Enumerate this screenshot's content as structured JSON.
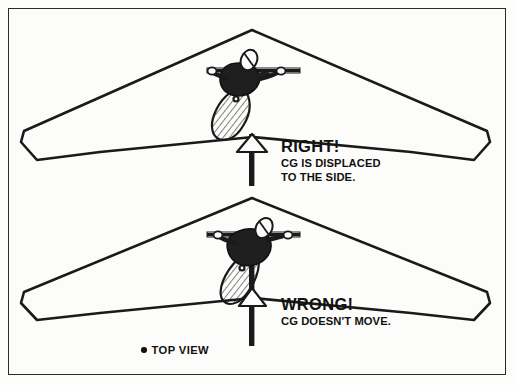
{
  "figure": {
    "background_color": "#fcfcfa",
    "ink_color": "#1a1a1a",
    "border_color": "#2b2b2b"
  },
  "panels": [
    {
      "id": "upper",
      "verdict": "RIGHT!",
      "explanation_line_1": "CG IS DISPLACED",
      "explanation_line_2": "TO THE SIDE.",
      "pilot_position": "displaced-left-of-keel"
    },
    {
      "id": "lower",
      "verdict": "WRONG!",
      "explanation_line_1": "CG DOESN'T MOVE.",
      "explanation_line_2": "",
      "pilot_position": "centered-on-keel"
    }
  ],
  "legend": {
    "bullet": "bullet-dot",
    "label": "TOP VIEW"
  }
}
